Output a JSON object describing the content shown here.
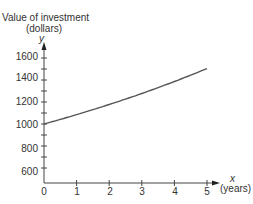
{
  "chart_data": {
    "type": "line",
    "title": "",
    "ylabel": "Value of investment (dollars)",
    "ylabel_line1": "Value of investment",
    "ylabel_line2": "(dollars)",
    "yvar": "y",
    "xlabel": "(years)",
    "xvar": "x",
    "x": [
      0,
      1,
      2,
      3,
      4,
      5
    ],
    "series": [
      {
        "name": "Value of investment",
        "values": [
          1000,
          1085,
          1177,
          1277,
          1386,
          1504
        ]
      }
    ],
    "xticks": [
      "0",
      "1",
      "2",
      "3",
      "4",
      "5"
    ],
    "yticks": [
      "600",
      "800",
      "1000",
      "1200",
      "1400",
      "1600"
    ],
    "ylim": [
      500,
      1700
    ],
    "xlim": [
      0,
      5.4
    ],
    "grid": false,
    "legend": null,
    "line_color": "#555555"
  }
}
